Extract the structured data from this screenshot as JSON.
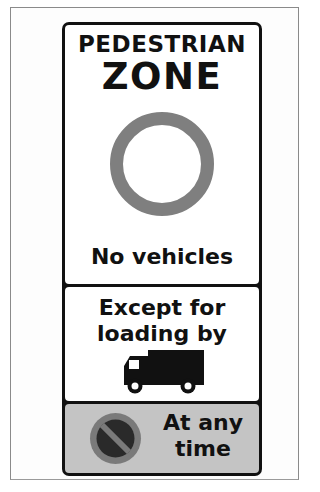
{
  "sign": {
    "top_panel": {
      "line1": "PEDESTRIAN",
      "line2": "ZONE",
      "symbol": "no-vehicles-ring-icon",
      "caption": "No vehicles"
    },
    "middle_panel": {
      "line1": "Except for",
      "line2": "loading by",
      "symbol": "lorry-icon"
    },
    "bottom_panel": {
      "symbol": "no-waiting-icon",
      "line1": "At any",
      "line2": "time"
    },
    "colors": {
      "border": "#111111",
      "panel_bg": "#ffffff",
      "ring": "#7f7f7f",
      "bottom_panel_bg": "#c4c4c4",
      "no_waiting_ring": "#7a7a7a",
      "no_waiting_fill": "#2a2a2a"
    }
  }
}
